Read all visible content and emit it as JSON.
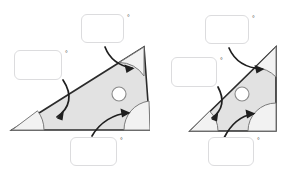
{
  "page": {
    "background_color": "#ffffff",
    "width": 298,
    "height": 176
  },
  "style": {
    "triangle_fill": "#e2e2e2",
    "triangle_stroke": "#2b2b2b",
    "arc_fill": "#f2f2f2",
    "arc_stroke": "#7a7a7a",
    "arrow_color": "#1f1f1f",
    "box_border": "#dcdcde",
    "box_fill": "#ffffff",
    "circle_fill": "#ffffff",
    "circle_stroke": "#8a8a8a",
    "degree_color": "#4a4a4a"
  },
  "figures": [
    {
      "id": "figure-left",
      "name": "left-triangle-figure",
      "clipped_right_edge": true,
      "triangle": {
        "vertices": [
          {
            "name": "bottom-left",
            "x": 12,
            "y": 130
          },
          {
            "name": "apex-top-right",
            "x": 144,
            "y": 47
          },
          {
            "name": "bottom-right",
            "x": 150,
            "y": 130
          }
        ]
      },
      "marker_circle": {
        "cx": 119,
        "cy": 94,
        "r": 7
      },
      "angles": [
        {
          "name": "angle-bottom-left",
          "vertex": "bottom-left"
        },
        {
          "name": "angle-apex",
          "vertex": "apex-top-right"
        },
        {
          "name": "angle-bottom-right",
          "vertex": "bottom-right"
        }
      ],
      "answer_boxes": [
        {
          "name": "answer-box-left",
          "value": "",
          "placeholder": "",
          "degree_symbol": "°",
          "x": 14,
          "y": 50,
          "w": 48,
          "h": 30,
          "deg_x": 65,
          "deg_y": 50,
          "points_to": "angle-bottom-left"
        },
        {
          "name": "answer-box-top",
          "value": "",
          "placeholder": "",
          "degree_symbol": "°",
          "x": 81,
          "y": 14,
          "w": 43,
          "h": 29,
          "deg_x": 127,
          "deg_y": 14,
          "points_to": "angle-apex"
        },
        {
          "name": "answer-box-bottom",
          "value": "",
          "placeholder": "",
          "degree_symbol": "°",
          "x": 70,
          "y": 137,
          "w": 47,
          "h": 29,
          "deg_x": 120,
          "deg_y": 137,
          "points_to": "angle-bottom-right"
        }
      ],
      "arrows": [
        {
          "name": "arrow-to-bottom-left-angle",
          "from": "answer-box-left",
          "to": "angle-bottom-left"
        },
        {
          "name": "arrow-to-apex-angle",
          "from": "answer-box-top",
          "to": "angle-apex"
        },
        {
          "name": "arrow-to-bottom-right-angle",
          "from": "answer-box-bottom",
          "to": "angle-bottom-right"
        }
      ]
    },
    {
      "id": "figure-right",
      "name": "right-triangle-figure",
      "clipped_right_edge": false,
      "triangle": {
        "vertices": [
          {
            "name": "bottom-left",
            "x": 41,
            "y": 131
          },
          {
            "name": "apex-top-right",
            "x": 127,
            "y": 47
          },
          {
            "name": "bottom-right",
            "x": 127,
            "y": 131
          }
        ]
      },
      "marker_circle": {
        "cx": 93,
        "cy": 94,
        "r": 7
      },
      "angles": [
        {
          "name": "angle-bottom-left",
          "vertex": "bottom-left"
        },
        {
          "name": "angle-apex",
          "vertex": "apex-top-right"
        },
        {
          "name": "angle-bottom-right",
          "vertex": "bottom-right"
        }
      ],
      "answer_boxes": [
        {
          "name": "answer-box-left",
          "value": "",
          "placeholder": "",
          "degree_symbol": "°",
          "x": 22,
          "y": 57,
          "w": 46,
          "h": 30,
          "deg_x": 71,
          "deg_y": 57,
          "points_to": "angle-bottom-left"
        },
        {
          "name": "answer-box-top",
          "value": "",
          "placeholder": "",
          "degree_symbol": "°",
          "x": 56,
          "y": 15,
          "w": 44,
          "h": 29,
          "deg_x": 103,
          "deg_y": 15,
          "points_to": "angle-apex"
        },
        {
          "name": "answer-box-bottom",
          "value": "",
          "placeholder": "",
          "degree_symbol": "°",
          "x": 59,
          "y": 137,
          "w": 46,
          "h": 29,
          "deg_x": 108,
          "deg_y": 137,
          "points_to": "angle-bottom-right"
        }
      ],
      "arrows": [
        {
          "name": "arrow-to-bottom-left-angle",
          "from": "answer-box-left",
          "to": "angle-bottom-left"
        },
        {
          "name": "arrow-to-apex-angle",
          "from": "answer-box-top",
          "to": "angle-apex"
        },
        {
          "name": "arrow-to-bottom-right-angle",
          "from": "answer-box-bottom",
          "to": "angle-bottom-right"
        }
      ]
    }
  ]
}
